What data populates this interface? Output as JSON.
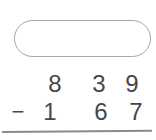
{
  "worksheet": {
    "type": "vertical-subtraction",
    "answer_box": {
      "value": "",
      "shape": "pill"
    },
    "problem": {
      "minuend": "839",
      "subtrahend": "167",
      "operator": "−",
      "minuend_digits": [
        "8",
        "3",
        "9"
      ],
      "subtrahend_digits": [
        "1",
        "6",
        "7"
      ]
    },
    "colors": {
      "digit": "#474747",
      "pill_border": "#a6a6a6",
      "answer_line": "#8a8a8a",
      "background": "#ffffff"
    }
  }
}
